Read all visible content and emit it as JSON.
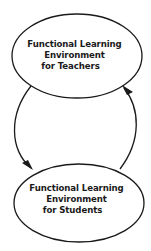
{
  "diagram": {
    "nodes": [
      {
        "id": "teachers",
        "lines": [
          "Functional Learning",
          "Environment",
          "for Teachers"
        ]
      },
      {
        "id": "students",
        "lines": [
          "Functional Learning",
          "Environment",
          "for Students"
        ]
      }
    ],
    "edges": [
      {
        "from": "teachers",
        "to": "students",
        "side": "left"
      },
      {
        "from": "students",
        "to": "teachers",
        "side": "right"
      }
    ],
    "colors": {
      "stroke": "#1a1a1a",
      "background": "#ffffff"
    }
  }
}
